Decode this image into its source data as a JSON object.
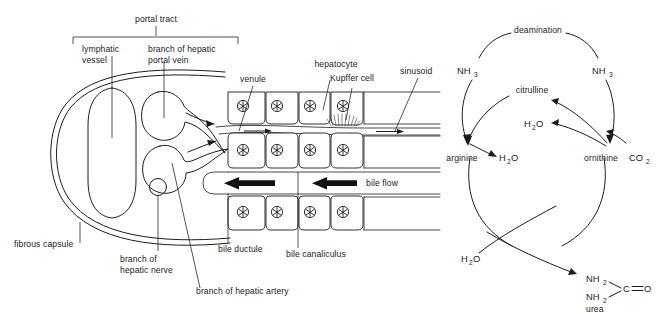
{
  "figure": {
    "ink_color": "#1c1c1c",
    "background": "#ffffff"
  },
  "left_diagram": {
    "name": "liver-lobule-portal-tract",
    "bracket_label": "portal tract",
    "labels": {
      "lymphatic_vessel": "lymphatic\nvessel",
      "lymphatic_vessel_line1": "lymphatic",
      "lymphatic_vessel_line2": "vessel",
      "portal_vein_line1": "branch of hepatic",
      "portal_vein_line2": "portal vein",
      "venule": "venule",
      "hepatocyte": "hepatocyte",
      "kupffer_cell": "Kupffer cell",
      "sinusoid": "sinusoid",
      "bile_flow": "bile flow",
      "fibrous_capsule": "fibrous capsule",
      "hepatic_nerve_line1": "branch of",
      "hepatic_nerve_line2": "hepatic nerve",
      "hepatic_artery": "branch of hepatic artery",
      "bile_ductule": "bile ductule",
      "bile_canaliculus": "bile canaliculus"
    },
    "flow_directions": {
      "blood": "rightward",
      "bile": "leftward"
    },
    "cell_rows": [
      {
        "row": "upper-hepatocyte-row",
        "cell_count": 4
      },
      {
        "row": "middle-hepatocyte-row",
        "cell_count": 4
      },
      {
        "row": "lower-hepatocyte-row",
        "cell_count": 4
      }
    ]
  },
  "right_diagram": {
    "name": "urea-cycle",
    "nodes": {
      "deamination": "deamination",
      "ammonia_left": "NH",
      "ammonia_left_sub": "3",
      "ammonia_right": "NH",
      "ammonia_right_sub": "3",
      "citrulline": "citrulline",
      "water_mid": "H",
      "water_mid_sub": "2",
      "water_mid_tail": "O",
      "arginine": "arginine",
      "water_arginine": "H",
      "water_arginine_sub": "2",
      "water_arginine_tail": "O",
      "ornithine": "ornithine",
      "carbon_dioxide": "CO",
      "carbon_dioxide_sub": "2",
      "water_bottom": "H",
      "water_bottom_sub": "2",
      "water_bottom_tail": "O",
      "urea_label": "urea",
      "urea_amine_1": "NH",
      "urea_amine_1_sub": "2",
      "urea_amine_2": "NH",
      "urea_amine_2_sub": "2",
      "urea_carbon": "C",
      "urea_oxygen": "O"
    }
  }
}
